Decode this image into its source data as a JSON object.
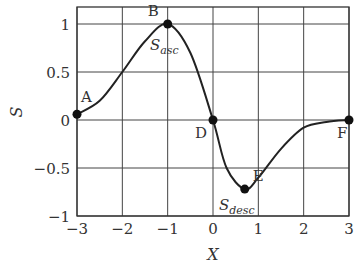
{
  "chart_data": {
    "type": "line",
    "title": "",
    "xlabel": "X",
    "ylabel": "S",
    "xlim": [
      -3,
      3
    ],
    "ylim": [
      -1,
      1.17
    ],
    "grid": true,
    "x_ticks": [
      -3,
      -2,
      -1,
      0,
      1,
      2,
      3
    ],
    "x_tick_labels": [
      "−3",
      "−2",
      "−1",
      "0",
      "1",
      "2",
      "3"
    ],
    "y_ticks": [
      -1,
      -0.5,
      0,
      0.5,
      1
    ],
    "y_tick_labels": [
      "−1",
      "−0.5",
      "0",
      "0.5",
      "1"
    ],
    "series": [
      {
        "name": "S(X)",
        "x": [
          -3,
          -2.5,
          -2,
          -1.5,
          -1,
          -0.5,
          0,
          0.3,
          0.7,
          1,
          1.5,
          2,
          2.5,
          3
        ],
        "y": [
          0.06,
          0.2,
          0.5,
          0.82,
          1.0,
          0.7,
          0,
          -0.5,
          -0.72,
          -0.6,
          -0.3,
          -0.08,
          -0.02,
          0
        ]
      }
    ],
    "points": [
      {
        "label": "A",
        "x": -3,
        "y": 0.06
      },
      {
        "label": "B",
        "x": -1,
        "y": 1.0
      },
      {
        "label": "D",
        "x": 0,
        "y": 0
      },
      {
        "label": "E",
        "x": 0.7,
        "y": -0.72
      },
      {
        "label": "F",
        "x": 3,
        "y": 0
      }
    ],
    "annotations": [
      {
        "text": "S",
        "sub": "asc",
        "near": "B"
      },
      {
        "text": "S",
        "sub": "desc",
        "near": "E"
      }
    ]
  }
}
